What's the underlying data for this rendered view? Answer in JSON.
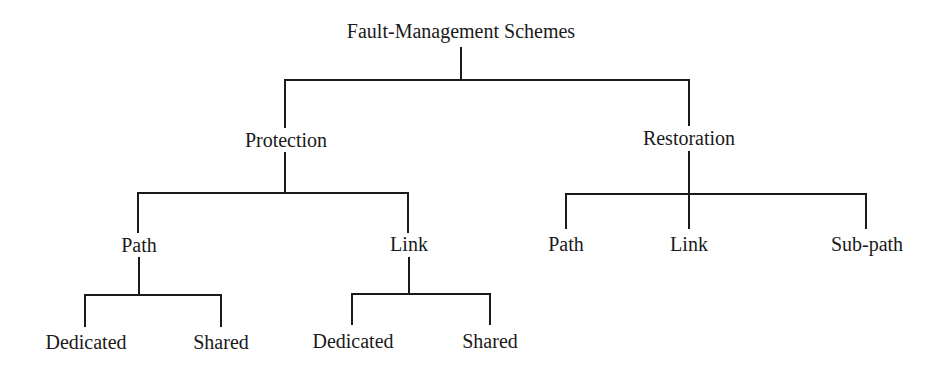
{
  "diagram": {
    "type": "tree",
    "line_color": "#1a1a1a",
    "text_color": "#1a1a1a",
    "background": "#ffffff",
    "root": {
      "label": "Fault-Management Schemes",
      "children": [
        {
          "label": "Protection",
          "children": [
            {
              "label": "Path",
              "children": [
                {
                  "label": "Dedicated"
                },
                {
                  "label": "Shared"
                }
              ]
            },
            {
              "label": "Link",
              "children": [
                {
                  "label": "Dedicated"
                },
                {
                  "label": "Shared"
                }
              ]
            }
          ]
        },
        {
          "label": "Restoration",
          "children": [
            {
              "label": "Path"
            },
            {
              "label": "Link"
            },
            {
              "label": "Sub-path"
            }
          ]
        }
      ]
    }
  },
  "nodes": {
    "root": "Fault-Management Schemes",
    "protection": "Protection",
    "restoration": "Restoration",
    "protection_path": "Path",
    "protection_link": "Link",
    "protection_path_dedicated": "Dedicated",
    "protection_path_shared": "Shared",
    "protection_link_dedicated": "Dedicated",
    "protection_link_shared": "Shared",
    "restoration_path": "Path",
    "restoration_link": "Link",
    "restoration_subpath": "Sub-path"
  }
}
